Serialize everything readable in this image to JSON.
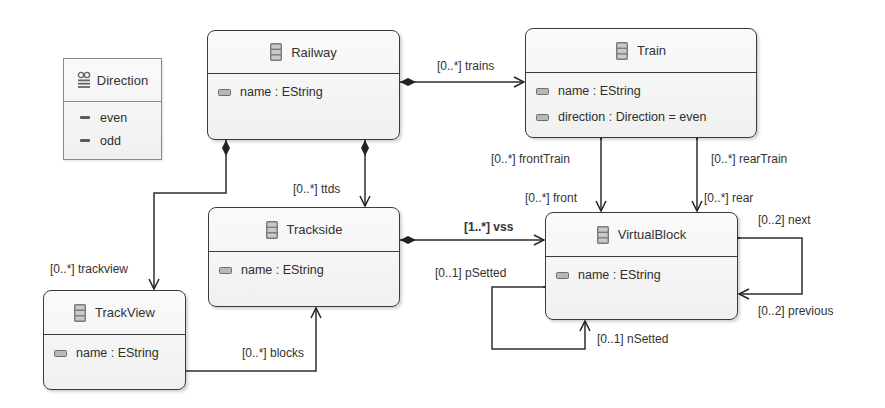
{
  "diagram": {
    "type": "Ecore class diagram",
    "colors": {
      "line": "#333333",
      "box_border": "#3a3a3a",
      "box_fill": "#f4f4f4",
      "icon": "#7a7a7a"
    }
  },
  "enums": [
    {
      "name": "Direction",
      "icon": "enum-icon",
      "literals": [
        "even",
        "odd"
      ]
    }
  ],
  "classes": {
    "railway": {
      "name": "Railway",
      "icon": "eclass-icon",
      "attributes": [
        "name : EString"
      ]
    },
    "train": {
      "name": "Train",
      "icon": "eclass-icon",
      "attributes": [
        "name : EString",
        "direction : Direction = even"
      ]
    },
    "trackside": {
      "name": "Trackside",
      "icon": "eclass-icon",
      "attributes": [
        "name : EString"
      ]
    },
    "trackview": {
      "name": "TrackView",
      "icon": "eclass-icon",
      "attributes": [
        "name : EString"
      ]
    },
    "virtualblock": {
      "name": "VirtualBlock",
      "icon": "eclass-icon",
      "attributes": [
        "name : EString"
      ]
    }
  },
  "references": [
    {
      "from": "Railway",
      "to": "Train",
      "label": "[0..*] trains",
      "kind": "containment"
    },
    {
      "from": "Railway",
      "to": "Trackside",
      "label": "[0..*] ttds",
      "kind": "containment"
    },
    {
      "from": "Railway",
      "to": "TrackView",
      "label": "[0..*] trackview",
      "kind": "containment"
    },
    {
      "from": "Trackside",
      "to": "VirtualBlock",
      "label": "[1..*] vss",
      "kind": "containment"
    },
    {
      "from": "TrackView",
      "to": "Trackside",
      "label": "[0..*] blocks",
      "kind": "reference"
    },
    {
      "from": "VirtualBlock",
      "to": "Train",
      "label": "[0..*] frontTrain",
      "kind": "bidirectional"
    },
    {
      "from": "Train",
      "to": "VirtualBlock",
      "label": "[0..*] front",
      "kind": "bidirectional"
    },
    {
      "from": "VirtualBlock",
      "to": "Train",
      "label": "[0..*] rearTrain",
      "kind": "bidirectional"
    },
    {
      "from": "Train",
      "to": "VirtualBlock",
      "label": "[0..*] rear",
      "kind": "bidirectional"
    },
    {
      "from": "VirtualBlock",
      "to": "VirtualBlock",
      "label": "[0..2] next",
      "kind": "self"
    },
    {
      "from": "VirtualBlock",
      "to": "VirtualBlock",
      "label": "[0..2] previous",
      "kind": "self"
    },
    {
      "from": "VirtualBlock",
      "to": "VirtualBlock",
      "label": "[0..1] pSetted",
      "kind": "self"
    },
    {
      "from": "VirtualBlock",
      "to": "VirtualBlock",
      "label": "[0..1] nSetted",
      "kind": "self"
    }
  ],
  "labels": {
    "trains": "[0..*] trains",
    "ttds": "[0..*] ttds",
    "trackview": "[0..*] trackview",
    "vss": "[1..*] vss",
    "blocks": "[0..*] blocks",
    "frontTrain": "[0..*] frontTrain",
    "front": "[0..*] front",
    "rearTrain": "[0..*] rearTrain",
    "rear": "[0..*] rear",
    "next": "[0..2] next",
    "previous": "[0..2] previous",
    "pSetted": "[0..1] pSetted",
    "nSetted": "[0..1] nSetted"
  }
}
